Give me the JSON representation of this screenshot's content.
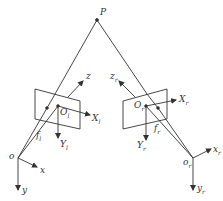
{
  "diagram": {
    "type": "stereo camera geometry",
    "point": {
      "label": "P"
    },
    "left_camera": {
      "image_plane_origin": "O",
      "image_plane_origin_sub": "l",
      "image_x_axis": "X",
      "image_x_axis_sub": "l",
      "image_y_axis": "Y",
      "image_y_axis_sub": "l",
      "focal_length": "f",
      "focal_length_sub": "l",
      "optical_axis": "z",
      "camera_origin": "o",
      "camera_x_axis": "x",
      "camera_y_axis": "y"
    },
    "right_camera": {
      "image_plane_origin": "O",
      "image_plane_origin_sub": "r",
      "image_x_axis": "X",
      "image_x_axis_sub": "r",
      "image_y_axis": "Y",
      "image_y_axis_sub": "r",
      "focal_length": "f",
      "focal_length_sub": "r",
      "optical_axis": "z",
      "optical_axis_sub": "r",
      "camera_origin": "o",
      "camera_origin_sub": "r",
      "camera_x_axis": "x",
      "camera_x_axis_sub": "r",
      "camera_y_axis": "y",
      "camera_y_axis_sub": "r"
    },
    "colors": {
      "line": "#333333",
      "background": "#ffffff"
    }
  }
}
